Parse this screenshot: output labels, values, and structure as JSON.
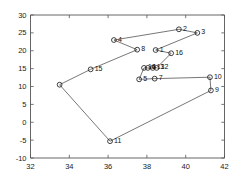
{
  "chart_data": {
    "type": "scatter",
    "title": "",
    "subtitle": "",
    "xlabel": "",
    "ylabel": "",
    "xlim": [
      32,
      42
    ],
    "ylim": [
      -10,
      30
    ],
    "xticks": [
      32,
      34,
      36,
      38,
      40,
      42
    ],
    "yticks": [
      -10,
      -5,
      0,
      5,
      10,
      15,
      20,
      25,
      30
    ],
    "xtick_labels": [
      "32",
      "34",
      "36",
      "38",
      "40",
      "42"
    ],
    "ytick_labels": [
      "-10",
      "-5",
      "0",
      "5",
      "10",
      "15",
      "20",
      "25",
      "30"
    ],
    "grid": false,
    "legend": null,
    "marker": "circle-open",
    "line_color": "#4a4a4a",
    "marker_color": "#1f1f1f",
    "axis_color": "#555555",
    "background": "#ffffff",
    "points": [
      {
        "label": "1",
        "x": 38.45,
        "y": 20.2,
        "lx": 4,
        "ly": -1
      },
      {
        "label": "2",
        "x": 39.65,
        "y": 26.0,
        "lx": 4,
        "ly": -1
      },
      {
        "label": "3",
        "x": 40.6,
        "y": 25.0,
        "lx": 4,
        "ly": -1
      },
      {
        "label": "4",
        "x": 36.3,
        "y": 23.0,
        "lx": 4,
        "ly": -1
      },
      {
        "label": "5",
        "x": 37.6,
        "y": 12.0,
        "lx": 4,
        "ly": -1
      },
      {
        "label": "6",
        "x": 38.05,
        "y": 15.2,
        "lx": 4,
        "ly": -1
      },
      {
        "label": "7",
        "x": 38.4,
        "y": 12.2,
        "lx": 4,
        "ly": -1
      },
      {
        "label": "8",
        "x": 37.5,
        "y": 20.3,
        "lx": 4,
        "ly": -1
      },
      {
        "label": "9",
        "x": 41.3,
        "y": 8.9,
        "lx": 4,
        "ly": -1
      },
      {
        "label": "10",
        "x": 41.25,
        "y": 12.6,
        "lx": 4,
        "ly": -1
      },
      {
        "label": "11",
        "x": 36.1,
        "y": -5.3,
        "lx": 4,
        "ly": -1
      },
      {
        "label": "12",
        "x": 38.5,
        "y": 15.2,
        "lx": 4,
        "ly": -1
      },
      {
        "label": "13",
        "x": 38.3,
        "y": 15.2,
        "lx": 4,
        "ly": -1
      },
      {
        "label": "14",
        "x": 37.85,
        "y": 15.2,
        "lx": 4,
        "ly": -1
      },
      {
        "label": "15",
        "x": 35.1,
        "y": 14.8,
        "lx": 4,
        "ly": -1
      },
      {
        "label": "16",
        "x": 39.25,
        "y": 19.3,
        "lx": 4,
        "ly": -1
      }
    ],
    "unlabeled_points": [
      {
        "label": "",
        "x": 33.5,
        "y": 10.5
      }
    ],
    "tour_order_xy": [
      [
        33.5,
        10.5
      ],
      [
        35.1,
        14.8
      ],
      [
        37.5,
        20.3
      ],
      [
        36.3,
        23.0
      ],
      [
        39.65,
        26.0
      ],
      [
        40.6,
        25.0
      ],
      [
        38.45,
        20.2
      ],
      [
        39.25,
        19.3
      ],
      [
        38.5,
        15.2
      ],
      [
        38.3,
        15.2
      ],
      [
        38.05,
        15.2
      ],
      [
        37.85,
        15.2
      ],
      [
        37.6,
        12.0
      ],
      [
        38.4,
        12.2
      ],
      [
        41.25,
        12.6
      ],
      [
        41.3,
        8.9
      ],
      [
        36.1,
        -5.3
      ],
      [
        33.5,
        10.5
      ]
    ]
  }
}
